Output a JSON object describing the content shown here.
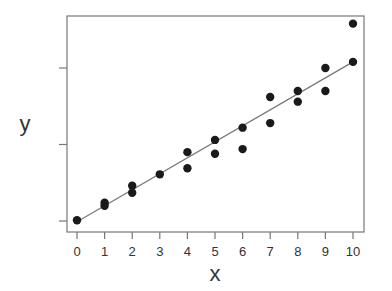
{
  "chart_data": {
    "type": "scatter",
    "title": "",
    "xlabel": "x",
    "ylabel": "y",
    "xlim": [
      0,
      10
    ],
    "ylim": [
      -1.5,
      27
    ],
    "x_ticks": [
      0,
      1,
      2,
      3,
      4,
      5,
      6,
      7,
      8,
      9,
      10
    ],
    "x_tick_labels": [
      "0",
      "1",
      "2",
      "3",
      "4",
      "5",
      "6",
      "7",
      "8",
      "9",
      "10"
    ],
    "y_ticks": [
      0,
      10,
      20
    ],
    "y_tick_labels": [
      "",
      "",
      ""
    ],
    "grid": false,
    "legend": null,
    "series": [
      {
        "name": "observations",
        "kind": "scatter",
        "x": [
          0,
          1,
          1,
          2,
          2,
          3,
          4,
          4,
          5,
          5,
          6,
          6,
          7,
          7,
          8,
          8,
          9,
          9,
          10,
          10
        ],
        "y": [
          0.1,
          2.4,
          2.0,
          4.6,
          3.7,
          6.1,
          9.0,
          6.9,
          10.6,
          8.8,
          12.2,
          9.4,
          16.2,
          12.8,
          17.0,
          15.6,
          20.0,
          17.0,
          20.8,
          25.8
        ]
      },
      {
        "name": "fitted line",
        "kind": "line",
        "x": [
          0,
          10
        ],
        "y": [
          -0.1,
          20.8
        ]
      }
    ]
  },
  "colors": {
    "points": "#1a1a1a",
    "line": "#777777",
    "frame": "#777777",
    "text": "#333333"
  }
}
